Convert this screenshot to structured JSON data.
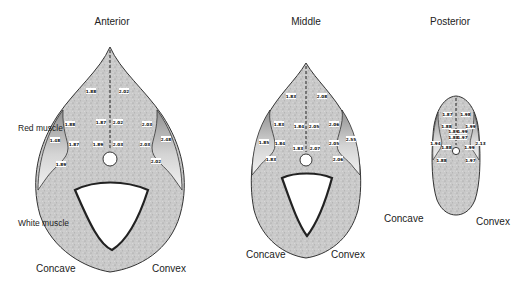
{
  "panels": [
    {
      "title": "Anterior",
      "labels": {
        "red_muscle": "Red muscle",
        "white_muscle": "White muscle",
        "left": "Concave",
        "right": "Convex"
      },
      "values": [
        "1.88",
        "2.02",
        "1.88",
        "1.87",
        "2.02",
        "2.03",
        "1.48",
        "1.87",
        "1.89",
        "2.03",
        "2.03",
        "2.48",
        "1.89",
        "2.02"
      ]
    },
    {
      "title": "Middle",
      "labels": {
        "left": "Concave",
        "right": "Convex"
      },
      "values": [
        "1.83",
        "2.08",
        "1.83",
        "1.84",
        "2.05",
        "2.06",
        "1.85",
        "1.84",
        "1.83",
        "2.07",
        "2.05",
        "2.55",
        "1.83",
        "2.06"
      ]
    },
    {
      "title": "Posterior",
      "labels": {
        "left": "Concave",
        "right": "Convex"
      },
      "values": [
        "1.87",
        "1.98",
        "1.88",
        "1.99",
        "1.89",
        "1.99",
        "1.88",
        "1.97",
        "1.94",
        "1.88",
        "1.99",
        "2.13",
        "1.88",
        "1.97"
      ]
    }
  ]
}
